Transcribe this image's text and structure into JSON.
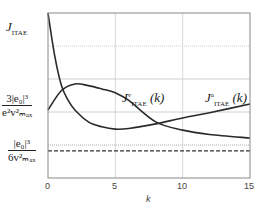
{
  "chart_data": {
    "type": "line",
    "title": "",
    "xlabel": "k",
    "ylabel": "",
    "xlim": [
      0,
      15
    ],
    "xticks": [
      0,
      5,
      10,
      15
    ],
    "ylim": [
      0,
      5
    ],
    "grid": true,
    "y_tick_labels": [
      {
        "value": 5.0,
        "label": "J_ITAE"
      },
      {
        "value": 2.0,
        "label": "3|e0|^3 / (e^2 v_max^2)"
      },
      {
        "value": 0.82,
        "label": "|e0|^3 / (6 v_max^2)"
      }
    ],
    "reference_lines": [
      {
        "name": "|e0|^3/(6 v_max^2)",
        "value": 0.82,
        "style": "dashed"
      },
      {
        "name": "upper dotted",
        "value": 1.0,
        "style": "dotted"
      }
    ],
    "series": [
      {
        "name": "J^v_ITAE(k)",
        "x": [
          0,
          1,
          2,
          3,
          4,
          5,
          6,
          8,
          10,
          12,
          15
        ],
        "values": [
          2.06,
          2.65,
          2.85,
          2.8,
          2.7,
          2.58,
          2.35,
          1.7,
          1.45,
          1.32,
          1.21
        ]
      },
      {
        "name": "J^a_ITAE(k)",
        "x": [
          0,
          0.5,
          1,
          1.5,
          2,
          3,
          4,
          5,
          6,
          8,
          10,
          12,
          15
        ],
        "values": [
          5.0,
          3.7,
          2.8,
          2.35,
          2.06,
          1.7,
          1.55,
          1.48,
          1.5,
          1.64,
          1.82,
          1.98,
          2.24
        ]
      }
    ]
  },
  "labels": {
    "x_axis": "k",
    "ticks": [
      "0",
      "5",
      "10",
      "15"
    ],
    "y_top": {
      "main": "J",
      "sub": "ITAE"
    },
    "y_mid": {
      "num": "3|e₀|³",
      "den": "e²v²ₘₐₓ"
    },
    "y_low": {
      "num": "|e₀|³",
      "den": "6v²ₘₐₓ"
    },
    "curve_v": {
      "main": "J",
      "sup": "v",
      "sub": "ITAE",
      "arg": "(k)"
    },
    "curve_a": {
      "main": "J",
      "sup": "a",
      "sub": "ITAE",
      "arg": "(k)"
    }
  }
}
